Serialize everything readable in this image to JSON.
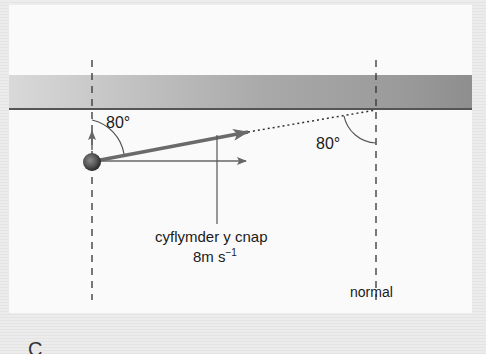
{
  "diagram": {
    "type": "ball-rebounding-off-wall (vector diagram)",
    "angle_left": "80°",
    "angle_right": "80°",
    "velocity_label_line1": "cyflymder y cnap",
    "velocity_label_line2_value": "8m s",
    "velocity_label_line2_exponent": "−1",
    "normal_label": "normal",
    "bottom_cut_text": "C"
  },
  "colors": {
    "band_light": "#d8d8d8",
    "band_dark": "#9a9a9a",
    "wall_line": "#5a5a5a",
    "arrow": "#666666",
    "ball": "#555555",
    "dashed": "#333333"
  }
}
